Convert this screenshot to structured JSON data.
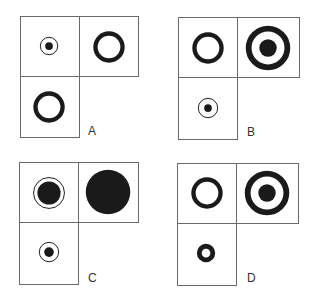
{
  "figure": {
    "colors": {
      "ink": "#1a1a1a",
      "border": "#6a6a6a",
      "background": "#ffffff"
    }
  },
  "panels": [
    {
      "label": "A",
      "cells": {
        "top_left": "small filled dot inside thin ring",
        "top_right": "thick hollow ring",
        "bottom_left": "thick hollow ring"
      }
    },
    {
      "label": "B",
      "cells": {
        "top_left": "thick hollow ring",
        "top_right": "large thick ring with filled center dot (target)",
        "bottom_left": "small filled dot inside thin ring"
      }
    },
    {
      "label": "C",
      "cells": {
        "top_left": "medium filled disc inside thin ring",
        "top_right": "large filled disc",
        "bottom_left": "small filled dot inside thin ring"
      }
    },
    {
      "label": "D",
      "cells": {
        "top_left": "thick hollow ring",
        "top_right": "large thick ring with filled center dot (target)",
        "bottom_left": "small thick ring with small hole"
      }
    }
  ]
}
